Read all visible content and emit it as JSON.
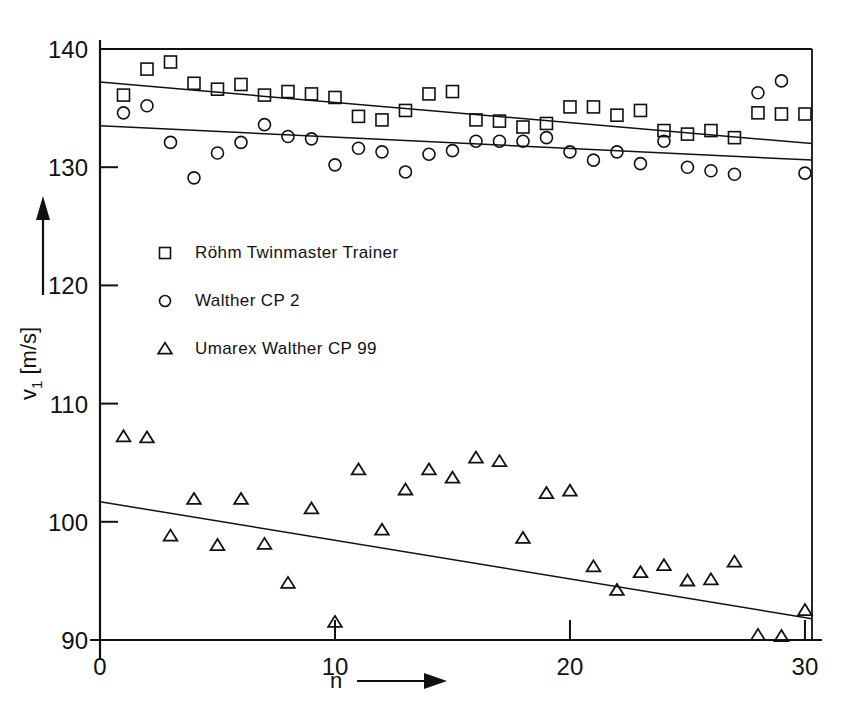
{
  "chart_data": {
    "type": "scatter",
    "title": "",
    "xlabel": "n",
    "ylabel": "v_1 [m/s]",
    "ylabel_parts": {
      "base": "v",
      "sub": "1",
      "unit": "[m/s]"
    },
    "xlim": [
      0,
      30.3
    ],
    "ylim": [
      90,
      140
    ],
    "xticks": [
      0,
      10,
      20,
      30
    ],
    "xticklabels": [
      "0",
      "10",
      "20",
      "30"
    ],
    "yticks": [
      90,
      100,
      110,
      120,
      130,
      140
    ],
    "yticklabels": [
      "90",
      "100",
      "110",
      "120",
      "130",
      "140"
    ],
    "grid": false,
    "legend_position": "center-left-inside",
    "axis_arrows": {
      "x": "right",
      "y": "up"
    },
    "series": [
      {
        "name": "Röhm Twinmaster Trainer",
        "marker": "square",
        "x": [
          1,
          2,
          3,
          4,
          5,
          6,
          7,
          8,
          9,
          10,
          11,
          12,
          13,
          14,
          15,
          16,
          17,
          18,
          19,
          20,
          21,
          22,
          23,
          24,
          25,
          26,
          27,
          28,
          29,
          30
        ],
        "y": [
          136.1,
          138.3,
          138.9,
          137.1,
          136.6,
          137.0,
          136.1,
          136.4,
          136.2,
          135.9,
          134.3,
          134.0,
          134.8,
          136.2,
          136.4,
          134.0,
          133.9,
          133.4,
          133.7,
          135.1,
          135.1,
          134.4,
          134.8,
          133.1,
          132.8,
          133.1,
          132.5,
          134.6,
          134.5,
          134.5
        ],
        "trendline": {
          "x0": 0,
          "y0": 137.2,
          "x1": 30.3,
          "y1": 132.0
        }
      },
      {
        "name": "Walther CP 2",
        "marker": "circle",
        "x": [
          1,
          2,
          3,
          4,
          5,
          6,
          7,
          8,
          9,
          10,
          11,
          12,
          13,
          14,
          15,
          16,
          17,
          18,
          19,
          20,
          21,
          22,
          23,
          24,
          25,
          26,
          27,
          28,
          29,
          30
        ],
        "y": [
          134.6,
          135.2,
          132.1,
          129.1,
          131.2,
          132.1,
          133.6,
          132.6,
          132.4,
          130.2,
          131.6,
          131.3,
          129.6,
          131.1,
          131.4,
          132.2,
          132.2,
          132.2,
          132.5,
          131.3,
          130.6,
          131.3,
          130.3,
          132.2,
          130.0,
          129.7,
          129.4,
          136.3,
          137.3,
          129.5
        ],
        "trendline": {
          "x0": 0,
          "y0": 133.5,
          "x1": 30.3,
          "y1": 130.6
        }
      },
      {
        "name": "Umarex Walther CP 99",
        "marker": "triangle",
        "x": [
          1,
          2,
          3,
          4,
          5,
          6,
          7,
          8,
          9,
          10,
          11,
          12,
          13,
          14,
          15,
          16,
          17,
          18,
          19,
          20,
          21,
          22,
          23,
          24,
          25,
          26,
          27,
          28,
          29,
          30
        ],
        "y": [
          107.2,
          107.1,
          98.8,
          101.9,
          98.0,
          101.9,
          98.1,
          94.8,
          101.1,
          91.5,
          104.4,
          99.3,
          102.7,
          104.4,
          103.7,
          105.4,
          105.1,
          98.6,
          102.4,
          102.6,
          96.2,
          94.2,
          95.7,
          96.3,
          95.0,
          95.1,
          96.6,
          90.4,
          90.3,
          92.5
        ],
        "trendline": {
          "x0": 0,
          "y0": 101.7,
          "x1": 30.3,
          "y1": 91.8
        }
      }
    ]
  },
  "legend": {
    "items": [
      {
        "marker": "square",
        "label": "Röhm Twinmaster Trainer"
      },
      {
        "marker": "circle",
        "label": "Walther CP 2"
      },
      {
        "marker": "triangle",
        "label": "Umarex Walther CP 99"
      }
    ]
  },
  "colors": {
    "ink": "#111111",
    "background": "#ffffff"
  }
}
